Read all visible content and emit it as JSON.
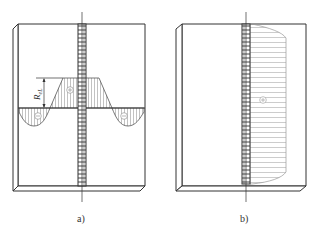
{
  "figure": {
    "panels": [
      {
        "id": "a",
        "caption": "a)",
        "description": "Plate with longitudinal weld; transverse stress distribution across the weld: tension plateau at weld, compression lobes on both sides",
        "dimension_label": "R_eL",
        "dimension_label_main": "R",
        "dimension_label_sub": "eL",
        "signs": [
          "+",
          "-",
          "-"
        ]
      },
      {
        "id": "b",
        "caption": "b)",
        "description": "Plate with longitudinal weld; stress distribution along the weld, tension over the weld length",
        "signs": [
          "+"
        ]
      }
    ],
    "colors": {
      "line": "#333333",
      "hatch": "#888888",
      "weld": "#444444"
    }
  }
}
